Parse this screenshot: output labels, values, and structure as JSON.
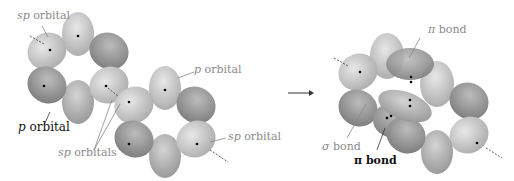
{
  "diagram": {
    "left_panel": {
      "labels": [
        {
          "prefix": "sp",
          "text": " orbital",
          "tone": "gray"
        },
        {
          "prefix": "p",
          "text": " orbital",
          "tone": "gray"
        },
        {
          "prefix": "p",
          "text": " orbital",
          "tone": "dark"
        },
        {
          "prefix": "sp",
          "text": " orbitals",
          "tone": "gray"
        },
        {
          "prefix": "sp",
          "text": " orbital",
          "tone": "gray"
        }
      ]
    },
    "arrow": {
      "direction": "right"
    },
    "right_panel": {
      "labels": [
        {
          "prefix": "π",
          "text": " bond",
          "tone": "gray"
        },
        {
          "prefix": "σ",
          "text": " bond",
          "tone": "gray"
        },
        {
          "prefix": "π",
          "text": " bond",
          "tone": "dark"
        }
      ]
    },
    "colors": {
      "lobe_light": "#d6d6d6",
      "lobe_mid": "#b4b4b4",
      "lobe_dark": "#8e8e8e",
      "label_gray": "#8a8a8a",
      "label_dark": "#111111"
    }
  }
}
